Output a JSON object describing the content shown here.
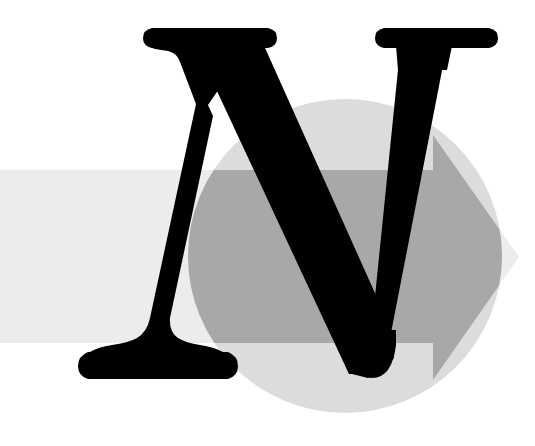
{
  "artwork": {
    "title": "Stylized letter N logo with circle and right-pointing arrow",
    "letter": "N",
    "alt_text": "Black serif capital letter N overlapping a light gray circle and a gray right-pointing arrow band",
    "canvas": {
      "width": 535,
      "height": 446,
      "background_color": "#ffffff"
    }
  },
  "elements": {
    "background": {
      "name": "white background",
      "color": "#ffffff"
    },
    "arrow_band": {
      "name": "right-pointing arrow band",
      "color_outside_circle": "#ececec",
      "color_inside_circle": "#a8a8a8",
      "direction": "right",
      "shaft_top_y": 170,
      "shaft_bottom_y": 343,
      "head_top_y": 135,
      "head_bottom_y": 380,
      "head_start_x": 433,
      "tip_x": 519,
      "tip_y": 257,
      "start_x": 0
    },
    "circle": {
      "name": "light gray circle",
      "color": "#dcdcdc",
      "center_x": 345,
      "center_y": 256,
      "radius": 157
    },
    "letter_n": {
      "name": "letter N glyph",
      "character": "N",
      "color": "#000000",
      "style": "serif-bold-italic"
    }
  },
  "palette": {
    "black": "#000000",
    "white": "#ffffff",
    "light_gray": "#ececec",
    "circle_gray": "#dcdcdc",
    "arrow_gray": "#a8a8a8"
  }
}
